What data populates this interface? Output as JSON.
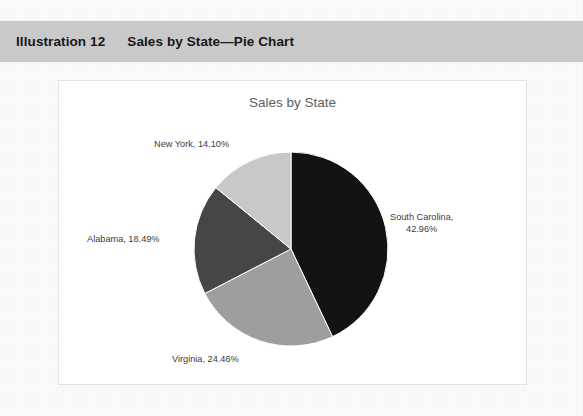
{
  "caption": {
    "label": "Illustration 12",
    "title": "Sales by State—Pie Chart"
  },
  "chart_data": {
    "type": "pie",
    "title": "Sales by State",
    "categories": [
      "South Carolina",
      "Virginia",
      "Alabama",
      "New York"
    ],
    "values": [
      42.96,
      24.46,
      18.49,
      14.1
    ],
    "value_unit": "%",
    "labels": [
      "South Carolina, 42.96%",
      "Virginia, 24.46%",
      "Alabama, 18.49%",
      "New York, 14.10%"
    ],
    "label_lines": {
      "south_carolina_line1": "South Carolina,",
      "south_carolina_line2": "42.96%",
      "virginia": "Virginia, 24.46%",
      "alabama": "Alabama, 18.49%",
      "new_york": "New York, 14.10%"
    },
    "colors": [
      "#131313",
      "#9e9e9e",
      "#464646",
      "#c8c8c8"
    ],
    "start_angle_deg": 0,
    "direction": "clockwise",
    "legend": "none",
    "grid": false,
    "xlabel": "",
    "ylabel": ""
  },
  "style": {
    "band_color": "#c9c9c9",
    "panel_background": "#ffffff",
    "panel_border": "#e3e3e3",
    "title_color": "#5d5d5d",
    "label_color": "#3b3b3b"
  }
}
